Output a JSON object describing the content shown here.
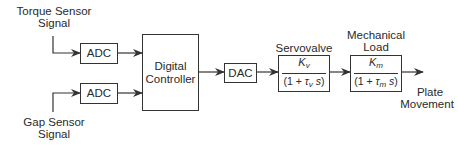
{
  "diagram": {
    "type": "block-diagram",
    "inputs": {
      "torque": {
        "line1": "Torque Sensor",
        "line2": "Signal"
      },
      "gap": {
        "line1": "Gap Sensor",
        "line2": "Signal"
      }
    },
    "blocks": {
      "adc_top": {
        "label": "ADC"
      },
      "adc_bottom": {
        "label": "ADC"
      },
      "controller": {
        "line1": "Digital",
        "line2": "Controller"
      },
      "dac": {
        "label": "DAC"
      },
      "servovalve": {
        "title": "Servovalve",
        "num_var": "K",
        "num_sub": "v",
        "den_prefix": "(1 + ",
        "den_tau": "τ",
        "den_tau_sub": "v",
        "den_s": "s",
        "den_suffix": ")"
      },
      "load": {
        "title_line1": "Mechanical",
        "title_line2": "Load",
        "num_var": "K",
        "num_sub": "m",
        "den_prefix": "(1 + ",
        "den_tau": "τ",
        "den_tau_sub": "m",
        "den_s": "s",
        "den_suffix": ")"
      }
    },
    "output": {
      "line1": "Plate",
      "line2": "Movement"
    },
    "colors": {
      "line": "#333333",
      "text": "#2a2a2a",
      "background": "#ffffff"
    }
  }
}
